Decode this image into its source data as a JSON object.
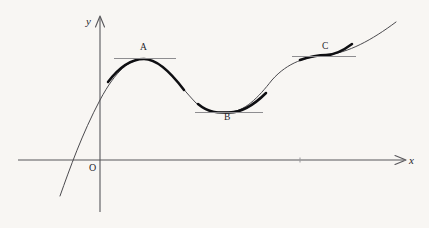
{
  "figure": {
    "kind": "cartesian-curve-diagram",
    "width": 429,
    "height": 228,
    "background_color": "#f8f6f3"
  },
  "axes": {
    "x_label": "x",
    "y_label": "y",
    "origin_label": "O",
    "axis_color": "#57565a",
    "x_axis_y_px": 160,
    "y_axis_x_px": 100,
    "x_axis_start_px": 18,
    "x_axis_end_px": 405,
    "y_axis_top_px": 16,
    "y_axis_bottom_px": 212
  },
  "curve": {
    "name": "f(x)",
    "color_thin": "#4b4a4e",
    "color_bold": "#0f0f12",
    "start_point_px": [
      60,
      196
    ],
    "end_point_px": [
      396,
      22
    ],
    "x_intercept_px": [
      73,
      160
    ],
    "y_intercept_px": [
      100,
      100
    ],
    "path": "M 60 196 C 70 168, 82 134, 100 100 C 116 70, 130 59, 144 59 C 162 59, 176 82, 196 103 C 210 114, 220 112, 229 112 C 244 112, 258 98, 272 80 C 288 62, 306 57, 326 55 C 348 53, 372 40, 396 22"
  },
  "critical_points": [
    {
      "label": "A",
      "type": "local-maximum",
      "point_px": [
        144,
        59
      ],
      "tangent": {
        "orientation": "horizontal",
        "slope": 0,
        "x_start_px": 114,
        "x_end_px": 176,
        "y_px": 58,
        "color": "#8e8d90"
      },
      "bold_segment": {
        "x_start_px": 108,
        "x_end_px": 184
      },
      "label_position_px": [
        140,
        43
      ]
    },
    {
      "label": "B",
      "type": "local-minimum",
      "point_px": [
        229,
        112
      ],
      "tangent": {
        "orientation": "horizontal",
        "slope": 0,
        "x_start_px": 195,
        "x_end_px": 263,
        "y_px": 112,
        "color": "#8e8d90"
      },
      "bold_segment": {
        "x_start_px": 198,
        "x_end_px": 266
      },
      "label_position_px": [
        224,
        113
      ]
    },
    {
      "label": "C",
      "type": "inflection-stationary",
      "point_px": [
        326,
        55
      ],
      "tangent": {
        "orientation": "horizontal",
        "slope": 0,
        "x_start_px": 292,
        "x_end_px": 356,
        "y_px": 56,
        "color": "#8e8d90"
      },
      "bold_segment": {
        "x_start_px": 300,
        "x_end_px": 352
      },
      "label_position_px": [
        322,
        42
      ]
    }
  ],
  "tick_marks": [
    {
      "x_px": 300,
      "y_px": 160
    }
  ],
  "chart_data": {
    "type": "line",
    "title": "",
    "xlabel": "x",
    "ylabel": "y",
    "grid": false,
    "legend": "none",
    "annotations": [
      "A",
      "B",
      "C",
      "O"
    ],
    "series": [
      {
        "name": "f(x)",
        "description": "Smooth cubic-like wave with a local maximum at A, a local minimum at B, and a stationary inflection at C",
        "x": [
          0.0,
          0.5,
          1.0,
          1.5,
          2.0,
          2.5,
          3.0,
          3.5,
          4.0,
          4.5,
          5.0,
          5.5,
          6.0,
          6.5,
          7.0,
          7.5,
          8.0,
          8.5,
          9.0,
          9.5,
          10.0
        ],
        "y": [
          -1.1,
          -0.2,
          0.7,
          1.5,
          2.1,
          2.6,
          2.9,
          3.0,
          2.9,
          2.6,
          2.1,
          1.6,
          1.3,
          1.2,
          1.2,
          1.5,
          2.1,
          2.7,
          3.1,
          3.2,
          3.3
        ]
      }
    ],
    "markers": [
      {
        "label": "A",
        "role": "local maximum",
        "tangent_slope": 0
      },
      {
        "label": "B",
        "role": "local minimum",
        "tangent_slope": 0
      },
      {
        "label": "C",
        "role": "stationary inflection point",
        "tangent_slope": 0
      }
    ]
  }
}
